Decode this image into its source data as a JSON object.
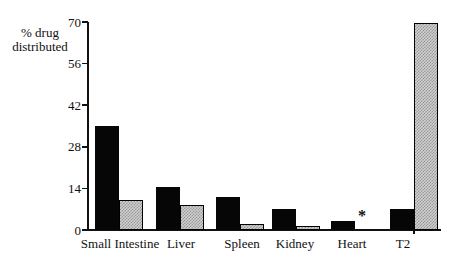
{
  "figure": {
    "background_color": "#ffffff",
    "axis_color": "#111111",
    "bar_colors": {
      "solid": "#060606",
      "stipple": "#c8c8c8"
    }
  },
  "chart_data": {
    "type": "bar",
    "title": "",
    "ylabel_lines": [
      "% drug",
      "distributed"
    ],
    "categories": [
      "Small Intestine",
      "Liver",
      "Spleen",
      "Kidney",
      "Heart",
      "T2"
    ],
    "series": [
      {
        "name": "solid-black",
        "values": [
          35,
          14.5,
          11,
          7,
          3,
          7
        ]
      },
      {
        "name": "gray-stipple",
        "values": [
          10,
          8.5,
          2,
          1.5,
          null,
          69.5
        ]
      }
    ],
    "y_ticks": [
      0,
      14,
      28,
      42,
      56,
      70
    ],
    "ylim": [
      0,
      70
    ],
    "grid": false,
    "legend": "none",
    "annotations": [
      {
        "text": "*",
        "category": "Heart",
        "series_index": 1
      }
    ]
  }
}
